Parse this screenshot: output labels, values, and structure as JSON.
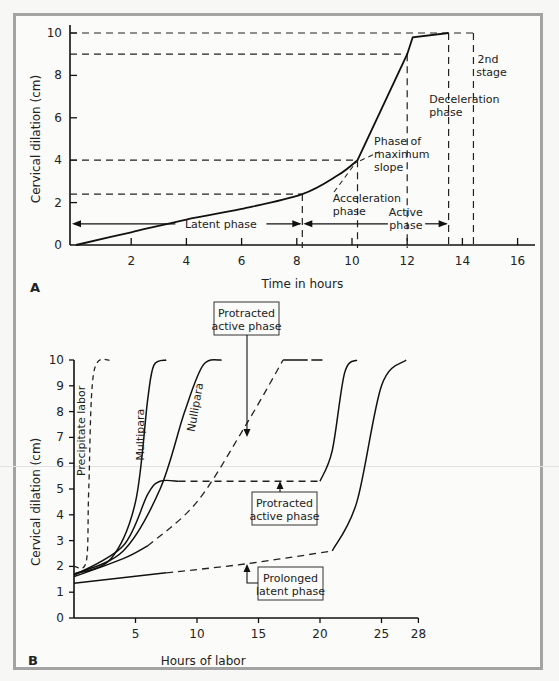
{
  "figure": {
    "panel_a_label": "A",
    "panel_b_label": "B"
  },
  "chart_data": [
    {
      "panel": "A",
      "type": "line",
      "title": "",
      "xlabel": "Time in hours",
      "ylabel": "Cervical dilation (cm)",
      "xlim": [
        0,
        16.5
      ],
      "ylim": [
        0,
        10
      ],
      "xticks": [
        2,
        4,
        6,
        8,
        10,
        12,
        14,
        16
      ],
      "yticks": [
        0,
        2,
        4,
        6,
        8,
        10
      ],
      "grid": false,
      "series": [
        {
          "name": "Labor curve",
          "style": "solid",
          "x": [
            0,
            2,
            4,
            6,
            8.2,
            9.5,
            10.2,
            12,
            12.2,
            13.5
          ],
          "y": [
            0,
            0.6,
            1.2,
            1.7,
            2.4,
            3.3,
            4.0,
            9.0,
            9.8,
            10.0
          ]
        }
      ],
      "reference_lines": {
        "horizontal_dashed_cm": [
          2.4,
          4,
          9,
          10
        ],
        "vertical_dashed_hours": [
          8.2,
          10.2,
          12,
          13.5,
          14.4
        ]
      },
      "annotations": [
        {
          "text": "Latent phase",
          "x_range": [
            0,
            8.2
          ],
          "y": 1
        },
        {
          "text": "Active phase",
          "x_range": [
            8.2,
            13.5
          ],
          "y": 1
        },
        {
          "text": "Acceleration phase",
          "x": 9.5,
          "y": 2.1
        },
        {
          "text": "Phase of maximum slope",
          "x": 11.8,
          "y": 4
        },
        {
          "text": "Deceleration phase",
          "x": 13.5,
          "y": 7
        },
        {
          "text": "2nd stage",
          "x": 14.5,
          "y": 8.5
        }
      ]
    },
    {
      "panel": "B",
      "type": "line",
      "title": "",
      "xlabel": "Hours of labor",
      "ylabel": "Cervical dilation (cm)",
      "xlim": [
        0,
        28
      ],
      "ylim": [
        0,
        10
      ],
      "xticks": [
        5,
        10,
        15,
        20,
        25,
        28
      ],
      "yticks": [
        0,
        1,
        2,
        3,
        4,
        5,
        6,
        7,
        8,
        9,
        10
      ],
      "grid": false,
      "series": [
        {
          "name": "Precipitate labor",
          "style": "dashed",
          "x": [
            0,
            1.0,
            1.2,
            1.6,
            3.0
          ],
          "y": [
            2.0,
            2.2,
            5.0,
            9.5,
            10.0
          ]
        },
        {
          "name": "Multipara",
          "style": "solid",
          "x": [
            0,
            3,
            5,
            6,
            6.5,
            7.5
          ],
          "y": [
            1.7,
            2.3,
            4.5,
            8.5,
            9.8,
            10.0
          ]
        },
        {
          "name": "Nullipara",
          "style": "solid",
          "x": [
            0,
            4,
            7,
            9,
            10.5,
            12
          ],
          "y": [
            1.7,
            2.6,
            5.0,
            8.0,
            9.8,
            10.0
          ]
        },
        {
          "name": "Protracted active phase (arrest)",
          "style": "solid+dashed",
          "x": [
            0,
            4,
            6,
            7,
            8.5,
            20,
            21,
            22,
            23
          ],
          "y": [
            1.65,
            2.8,
            4.8,
            5.3,
            5.3,
            5.3,
            6.5,
            9.5,
            10.0
          ]
        },
        {
          "name": "Protracted active phase",
          "style": "solid+dashed",
          "x": [
            0,
            4,
            6,
            10,
            14,
            17,
            20
          ],
          "y": [
            1.6,
            2.3,
            2.8,
            4.5,
            7.5,
            10.0,
            10.0
          ]
        },
        {
          "name": "Prolonged latent phase",
          "style": "solid+dashed",
          "x": [
            0,
            7.5,
            14,
            21,
            23,
            25,
            27
          ],
          "y": [
            1.35,
            1.75,
            2.1,
            2.6,
            4.5,
            9.0,
            10.0
          ]
        }
      ],
      "annotations": [
        {
          "text": "Precipitate labor",
          "x": 1,
          "y": 7
        },
        {
          "text": "Multipara",
          "x": 5,
          "y": 7.5
        },
        {
          "text": "Nullipara",
          "x": 8.5,
          "y": 8.5
        },
        {
          "text": "Protracted active phase",
          "box": true,
          "arrow_to": [
            14.5,
            7.3
          ]
        },
        {
          "text": "Protracted active phase",
          "box": true,
          "arrow_to": [
            16,
            5.3
          ]
        },
        {
          "text": "Prolonged latent phase",
          "box": true,
          "arrow_to": [
            14.3,
            2.1
          ]
        }
      ]
    }
  ]
}
